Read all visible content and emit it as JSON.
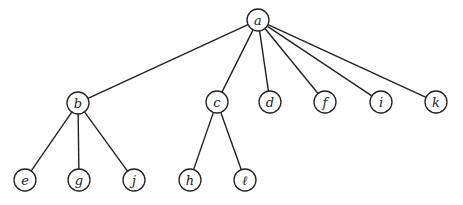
{
  "diagram": {
    "type": "tree",
    "root": "a",
    "colors": {
      "stroke": "#222222",
      "background": "#ffffff",
      "node_fill": "#ffffff"
    },
    "node_radius": 11,
    "nodes": [
      {
        "id": "a",
        "label": "a",
        "x": 258,
        "y": 20
      },
      {
        "id": "b",
        "label": "b",
        "x": 78,
        "y": 103
      },
      {
        "id": "c",
        "label": "c",
        "x": 217,
        "y": 102
      },
      {
        "id": "d",
        "label": "d",
        "x": 270,
        "y": 102
      },
      {
        "id": "f",
        "label": "f",
        "x": 325,
        "y": 102
      },
      {
        "id": "i",
        "label": "i",
        "x": 381,
        "y": 102
      },
      {
        "id": "k",
        "label": "k",
        "x": 436,
        "y": 102
      },
      {
        "id": "e",
        "label": "e",
        "x": 25,
        "y": 180
      },
      {
        "id": "g",
        "label": "g",
        "x": 79,
        "y": 180
      },
      {
        "id": "j",
        "label": "j",
        "x": 134,
        "y": 180
      },
      {
        "id": "h",
        "label": "h",
        "x": 190,
        "y": 180
      },
      {
        "id": "l",
        "label": "ℓ",
        "x": 245,
        "y": 180
      }
    ],
    "edges": [
      [
        "a",
        "b"
      ],
      [
        "a",
        "c"
      ],
      [
        "a",
        "d"
      ],
      [
        "a",
        "f"
      ],
      [
        "a",
        "i"
      ],
      [
        "a",
        "k"
      ],
      [
        "b",
        "e"
      ],
      [
        "b",
        "g"
      ],
      [
        "b",
        "j"
      ],
      [
        "c",
        "h"
      ],
      [
        "c",
        "l"
      ]
    ]
  }
}
